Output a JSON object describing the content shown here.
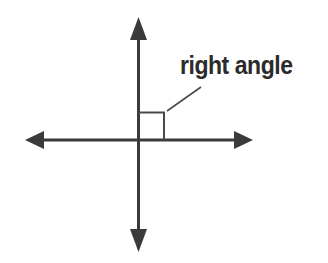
{
  "figure": {
    "background_color": "#ffffff",
    "width": 328,
    "height": 263,
    "stroke_color": "#3a3a3a",
    "marker_stroke_color": "#4a4a4a",
    "leader_color": "#4a4a4a",
    "text_color": "#2b2b2b"
  },
  "annotation": {
    "label": "right angle"
  },
  "geometry": {
    "origin_x": 138,
    "origin_y": 140,
    "vertical_axis_top": 17,
    "vertical_axis_bottom": 252,
    "horizontal_axis_left": 25,
    "horizontal_axis_right": 253,
    "axis_stroke_width": 3,
    "square_left": 138,
    "square_top": 112,
    "square_right": 165,
    "square_bottom": 140,
    "square_stroke_width": 2,
    "leader_x1": 167,
    "leader_y1": 111,
    "leader_x2": 201,
    "leader_y2": 87,
    "leader_stroke_width": 1.6
  }
}
